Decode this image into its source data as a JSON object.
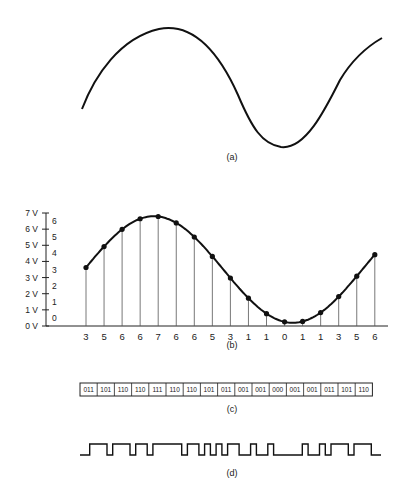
{
  "figure": {
    "panels": [
      {
        "id": "a",
        "caption": "(a)",
        "description": "Continuous analog sine waveform"
      },
      {
        "id": "b",
        "caption": "(b)",
        "description": "Sampled waveform with quantized levels"
      },
      {
        "id": "c",
        "caption": "(c)",
        "description": "3-bit binary codes of samples"
      },
      {
        "id": "d",
        "caption": "(d)",
        "description": "Serial pulse train of binary codes"
      }
    ]
  },
  "chart_data": {
    "type": "line",
    "title": "",
    "xlabel": "",
    "ylabel": "",
    "y_voltage_ticks": [
      "0 V",
      "1 V",
      "2 V",
      "3 V",
      "4 V",
      "5 V",
      "6 V",
      "7 V"
    ],
    "y_level_ticks": [
      "0",
      "1",
      "2",
      "3",
      "4",
      "5",
      "6"
    ],
    "ylim": [
      0,
      7
    ],
    "grid": false,
    "sample_levels": [
      3,
      5,
      6,
      6,
      7,
      6,
      6,
      5,
      3,
      1,
      1,
      0,
      1,
      1,
      3,
      5,
      6
    ],
    "sample_labels": [
      "3",
      "5",
      "6",
      "6",
      "7",
      "6",
      "6",
      "5",
      "3",
      "1",
      "1",
      "0",
      "1",
      "1",
      "3",
      "5",
      "6"
    ],
    "binary_codes": [
      "011",
      "101",
      "110",
      "110",
      "111",
      "110",
      "110",
      "101",
      "011",
      "001",
      "001",
      "000",
      "001",
      "001",
      "011",
      "101",
      "110"
    ]
  }
}
